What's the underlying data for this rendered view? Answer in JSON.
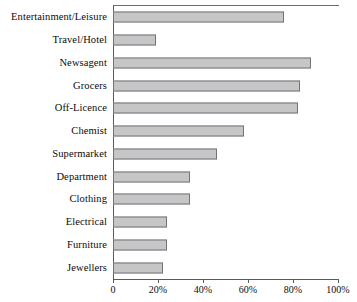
{
  "chart_data": {
    "type": "bar",
    "orientation": "horizontal",
    "title": "",
    "xlabel": "",
    "ylabel": "",
    "xlim": [
      0,
      100
    ],
    "grid": false,
    "legend": null,
    "xticks": [
      "0",
      "20%",
      "40%",
      "60%",
      "80%",
      "100%"
    ],
    "xtick_values": [
      0,
      20,
      40,
      60,
      80,
      100
    ],
    "categories": [
      "Entertainment/Leisure",
      "Travel/Hotel",
      "Newsagent",
      "Grocers",
      "Off-Licence",
      "Chemist",
      "Supermarket",
      "Department",
      "Clothing",
      "Electrical",
      "Furniture",
      "Jewellers"
    ],
    "values": [
      76,
      19,
      88,
      83,
      82,
      58,
      46,
      34,
      34,
      24,
      24,
      22
    ],
    "bars": [
      {
        "label": "Entertainment/Leisure",
        "value": 76
      },
      {
        "label": "Travel/Hotel",
        "value": 19
      },
      {
        "label": "Newsagent",
        "value": 88
      },
      {
        "label": "Grocers",
        "value": 83
      },
      {
        "label": "Off-Licence",
        "value": 82
      },
      {
        "label": "Chemist",
        "value": 58
      },
      {
        "label": "Supermarket",
        "value": 46
      },
      {
        "label": "Department",
        "value": 34
      },
      {
        "label": "Clothing",
        "value": 34
      },
      {
        "label": "Electrical",
        "value": 24
      },
      {
        "label": "Furniture",
        "value": 24
      },
      {
        "label": "Jewellers",
        "value": 22
      }
    ],
    "colors": {
      "bar_fill": "#c6c6c6",
      "bar_border": "#70747a",
      "axis": "#555a5e",
      "text": "#0b0b0b",
      "background": "#ffffff"
    }
  }
}
